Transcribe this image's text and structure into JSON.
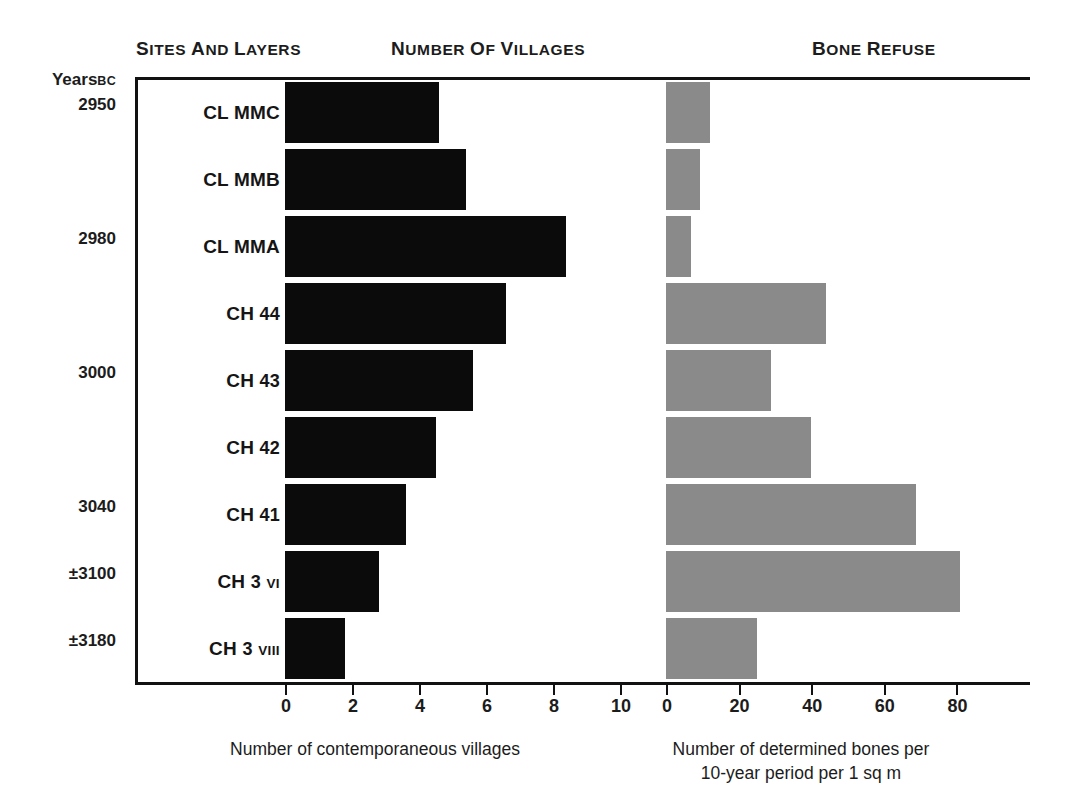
{
  "headings": {
    "sites_and_layers": "Sites and Layers",
    "number_of_villages": "Number of Villages",
    "bone_refuse": "Bone Refuse"
  },
  "years_axis": {
    "title": "Years",
    "era": "BC",
    "ticks": [
      "2950",
      "2980",
      "3000",
      "3040",
      "±3100",
      "±3180"
    ]
  },
  "captions": {
    "villages": "Number of contemporaneous villages",
    "bones_line1": "Number of determined bones per",
    "bones_line2": "10-year period per 1 sq m"
  },
  "axes": {
    "villages_ticks": [
      "0",
      "2",
      "4",
      "6",
      "8",
      "10"
    ],
    "bones_ticks": [
      "0",
      "20",
      "40",
      "60",
      "80"
    ]
  },
  "colors": {
    "villages_bar": "#0b0b0b",
    "bones_bar": "#8a8a8a",
    "axis": "#111111",
    "text": "#1c1c1c",
    "background": "#ffffff"
  },
  "chart_data": {
    "type": "bar",
    "orientation": "horizontal",
    "categories": [
      "CL MMC",
      "CL MMB",
      "CL MMA",
      "CH 44",
      "CH 43",
      "CH 42",
      "CH 41",
      "CH 3 VI",
      "CH 3 VIII"
    ],
    "category_years": [
      "2950",
      "",
      "2980",
      "",
      "3000",
      "",
      "3040",
      "±3100",
      "±3180"
    ],
    "series": [
      {
        "name": "Number of Villages",
        "xlabel": "Number of contemporaneous villages",
        "color": "#0b0b0b",
        "xlim": [
          0,
          10.6
        ],
        "ticks": [
          0,
          2,
          4,
          6,
          8,
          10
        ],
        "values": [
          4.6,
          5.4,
          8.4,
          6.6,
          5.6,
          4.5,
          3.6,
          2.8,
          1.8
        ]
      },
      {
        "name": "Bone Refuse",
        "xlabel": "Number of determined bones per 10-year period per 1 sq m",
        "color": "#8a8a8a",
        "xlim": [
          0,
          100
        ],
        "ticks": [
          0,
          20,
          40,
          60,
          80
        ],
        "values": [
          12,
          9.5,
          7,
          44,
          29,
          40,
          69,
          81,
          25
        ]
      }
    ],
    "ylabel": "Years BC",
    "grid": false,
    "legend": "none"
  },
  "rows": [
    {
      "label_main": "CL MMC",
      "label_num": "",
      "label_rom": "",
      "year": "2950",
      "villages": 4.6,
      "bones": 12
    },
    {
      "label_main": "CL MMB",
      "label_num": "",
      "label_rom": "",
      "year": "",
      "villages": 5.4,
      "bones": 9.5
    },
    {
      "label_main": "CL MMA",
      "label_num": "",
      "label_rom": "",
      "year": "2980",
      "villages": 8.4,
      "bones": 7
    },
    {
      "label_main": "CH",
      "label_num": "44",
      "label_rom": "",
      "year": "",
      "villages": 6.6,
      "bones": 44
    },
    {
      "label_main": "CH",
      "label_num": "43",
      "label_rom": "",
      "year": "3000",
      "villages": 5.6,
      "bones": 29
    },
    {
      "label_main": "CH",
      "label_num": "42",
      "label_rom": "",
      "year": "",
      "villages": 4.5,
      "bones": 40
    },
    {
      "label_main": "CH",
      "label_num": "41",
      "label_rom": "",
      "year": "3040",
      "villages": 3.6,
      "bones": 69
    },
    {
      "label_main": "CH",
      "label_num": "3",
      "label_rom": "VI",
      "year": "±3100",
      "villages": 2.8,
      "bones": 81
    },
    {
      "label_main": "CH",
      "label_num": "3",
      "label_rom": "VIII",
      "year": "±3180",
      "villages": 1.8,
      "bones": 25
    }
  ]
}
